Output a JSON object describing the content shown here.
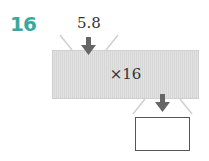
{
  "problem": {
    "number": "16",
    "input_value": "5.8",
    "operation": "×16",
    "answer": ""
  },
  "colors": {
    "number": "#3aa8a0",
    "arrow": "#666666",
    "machine": "#dcdcdc"
  }
}
